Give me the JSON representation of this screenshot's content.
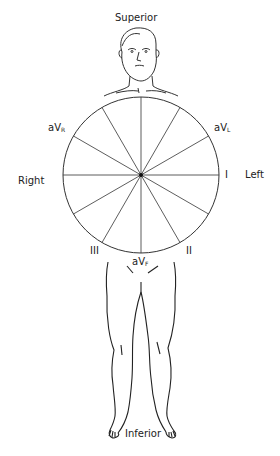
{
  "orientation": {
    "superior": "Superior",
    "inferior": "Inferior",
    "right": "Right",
    "left": "Left"
  },
  "leads": {
    "aVR": {
      "main": "aV",
      "sub": "R"
    },
    "aVL": {
      "main": "aV",
      "sub": "L"
    },
    "aVF": {
      "main": "aV",
      "sub": "F"
    },
    "I": "I",
    "II": "II",
    "III": "III"
  },
  "hexaxial_circle": {
    "center": [
      141,
      175
    ],
    "radius": 78,
    "spoke_count": 12,
    "spoke_angle_step_deg": 30
  },
  "colors": {
    "line": "#333333",
    "background": "#ffffff"
  }
}
